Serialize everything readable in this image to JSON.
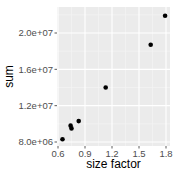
{
  "chart_data": {
    "type": "scatter",
    "title": "",
    "xlabel": "size factor",
    "ylabel": "sum",
    "xlim": [
      0.6,
      1.82
    ],
    "ylim": [
      7900000.0,
      23000000.0
    ],
    "x_ticks": [
      0.6,
      0.9,
      1.2,
      1.5,
      1.8
    ],
    "x_tick_labels": [
      "0.6",
      "0.9",
      "1.2",
      "1.5",
      "1.8"
    ],
    "y_ticks": [
      8000000.0,
      12000000.0,
      16000000.0,
      20000000.0
    ],
    "y_tick_labels": [
      "8.0e+06",
      "1.2e+07",
      "1.6e+07",
      "2.0e+07"
    ],
    "grid": true,
    "legend": null,
    "points": [
      {
        "x": 0.65,
        "y": 8300000.0
      },
      {
        "x": 0.74,
        "y": 9800000.0
      },
      {
        "x": 0.75,
        "y": 9500000.0
      },
      {
        "x": 0.83,
        "y": 10300000.0
      },
      {
        "x": 1.13,
        "y": 14000000.0
      },
      {
        "x": 1.63,
        "y": 18700000.0
      },
      {
        "x": 1.79,
        "y": 21900000.0
      }
    ]
  },
  "colors": {
    "panel": "#ebebeb",
    "grid_major": "#ffffff",
    "point": "#000000"
  }
}
